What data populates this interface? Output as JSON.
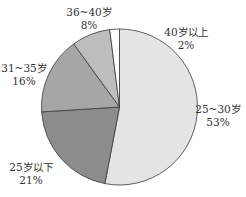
{
  "chart_data": {
    "type": "pie",
    "title": "",
    "start_angle": "12 o'clock",
    "direction": "clockwise",
    "categories": [
      "25~30岁",
      "25岁以下",
      "31~35岁",
      "36~40岁",
      "40岁以上"
    ],
    "values": [
      53,
      21,
      16,
      8,
      2
    ],
    "unit": "%",
    "slices": [
      {
        "label": "25~30岁",
        "value": 53,
        "display": "53%",
        "color": "#e4e4e4"
      },
      {
        "label": "25岁以下",
        "value": 21,
        "display": "21%",
        "color": "#8c8c8c"
      },
      {
        "label": "31~35岁",
        "value": 16,
        "display": "16%",
        "color": "#a6a6a6"
      },
      {
        "label": "36~40岁",
        "value": 8,
        "display": "8%",
        "color": "#bdbdbd"
      },
      {
        "label": "40岁以上",
        "value": 2,
        "display": "2%",
        "color": "#ffffff"
      }
    ],
    "legend": "none (labels placed outside slices)"
  },
  "style": {
    "stroke": "#3a3a3a",
    "background": "#ffffff"
  },
  "labels": [
    {
      "name": "25~30岁",
      "pct": "53%",
      "x": 218,
      "y": 103
    },
    {
      "name": "25岁以下",
      "pct": "21%",
      "x": 31,
      "y": 161
    },
    {
      "name": "31~35岁",
      "pct": "16%",
      "x": 24,
      "y": 62
    },
    {
      "name": "36~40岁",
      "pct": "8%",
      "x": 89,
      "y": 6
    },
    {
      "name": "40岁以上",
      "pct": "2%",
      "x": 186,
      "y": 26
    }
  ]
}
